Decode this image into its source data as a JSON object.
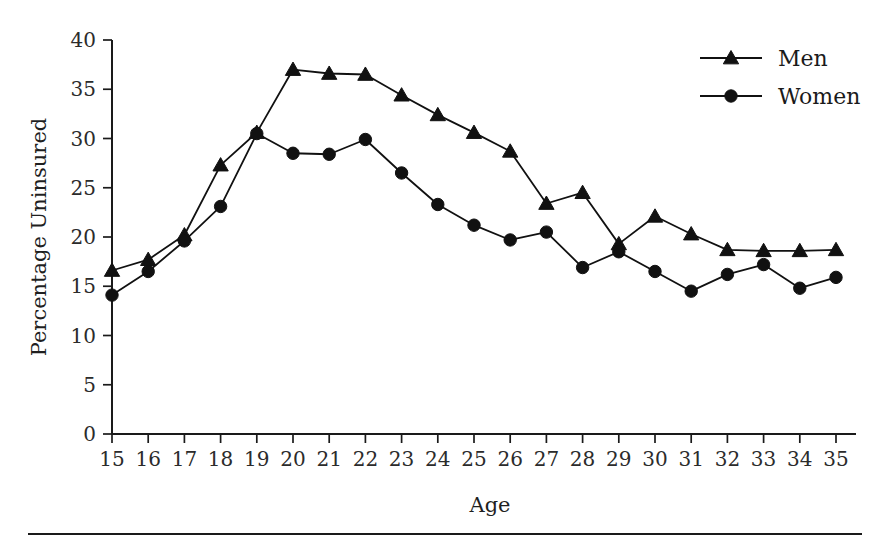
{
  "chart_data": {
    "type": "line",
    "title": "",
    "xlabel": "Age",
    "ylabel": "Percentage Uninsured",
    "xlim": [
      15,
      35
    ],
    "ylim": [
      0,
      40
    ],
    "ytick_step": 5,
    "grid": false,
    "legend_position": "top-right",
    "x": [
      15,
      16,
      17,
      18,
      19,
      20,
      21,
      22,
      23,
      24,
      25,
      26,
      27,
      28,
      29,
      30,
      31,
      32,
      33,
      34,
      35
    ],
    "xtick_labels": [
      "15",
      "16",
      "17",
      "18",
      "19",
      "20",
      "21",
      "22",
      "23",
      "24",
      "25",
      "26",
      "27",
      "28",
      "29",
      "30",
      "31",
      "32",
      "33",
      "34",
      "35"
    ],
    "ytick_labels": [
      "0",
      "5",
      "10",
      "15",
      "20",
      "25",
      "30",
      "35",
      "40"
    ],
    "series": [
      {
        "name": "Men",
        "marker": "triangle",
        "color": "#111111",
        "values": [
          16.6,
          17.7,
          20.2,
          27.3,
          30.6,
          37.0,
          36.6,
          36.5,
          34.4,
          32.4,
          30.6,
          28.7,
          23.4,
          24.5,
          19.3,
          22.1,
          20.3,
          18.7,
          18.6,
          18.6,
          18.7
        ]
      },
      {
        "name": "Women",
        "marker": "circle",
        "color": "#111111",
        "values": [
          14.1,
          16.5,
          19.6,
          23.1,
          30.5,
          28.5,
          28.4,
          29.9,
          26.5,
          23.3,
          21.2,
          19.7,
          20.5,
          16.9,
          18.5,
          16.5,
          14.5,
          16.2,
          17.2,
          14.8,
          15.9
        ]
      }
    ]
  },
  "legend": {
    "entries": [
      {
        "label": "Men",
        "marker": "triangle-marker"
      },
      {
        "label": "Women",
        "marker": "circle-marker"
      }
    ]
  },
  "axes": {
    "x_title": "Age",
    "y_title": "Percentage Uninsured"
  }
}
